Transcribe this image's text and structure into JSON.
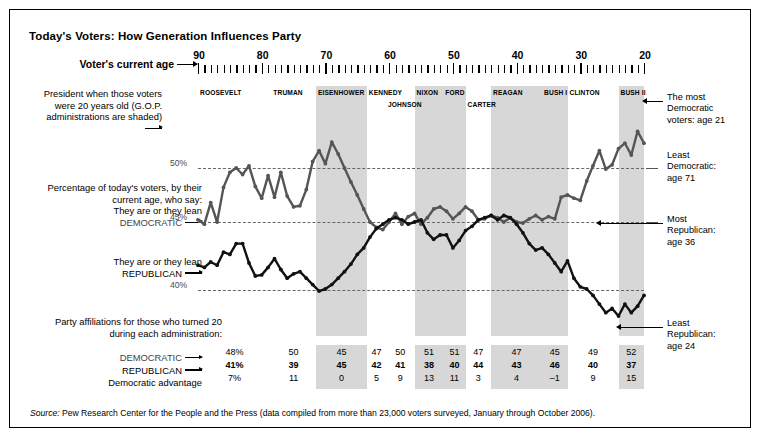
{
  "title": "Today's Voters: How Generation Influences Party",
  "axis": {
    "label": "Voter's current age",
    "ticks": [
      "90",
      "80",
      "70",
      "60",
      "50",
      "40",
      "30",
      "20"
    ],
    "min_age": 20,
    "max_age": 90
  },
  "president_caption": "President when those voters were 20 years old (G.O.P. administrations are shaded)",
  "pct_caption_1": "Percentage of today's voters, by their current age, who say:",
  "pct_caption_2": "They are or they lean",
  "dem_caption": "DEMOCRATIC",
  "rep_caption_2": "They are or they lean",
  "rep_caption": "REPUBLICAN",
  "party_caption": "Party affiliations for those who turned 20 during each administration:",
  "row_labels": {
    "democratic": "DEMOCRATIC",
    "republican": "REPUBLICAN",
    "advantage": "Democratic advantage"
  },
  "gridlines": [
    {
      "label": "50%",
      "value": 50
    },
    {
      "label": "45%",
      "value": 45
    },
    {
      "label": "40%",
      "value": 40
    }
  ],
  "annotations": [
    {
      "name": "most-democratic",
      "lines": [
        "The most",
        "Democratic",
        "voters: age 21"
      ]
    },
    {
      "name": "least-democratic",
      "lines": [
        "Least",
        "Democratic:",
        "age 71"
      ]
    },
    {
      "name": "most-republican",
      "lines": [
        "Most",
        "Republican:",
        "age 36"
      ]
    },
    {
      "name": "least-republican",
      "lines": [
        "Least",
        "Republican:",
        "age 24"
      ]
    }
  ],
  "source": {
    "prefix": "Source:",
    "text": " Pew Research Center for the People and the Press (data compiled from more than 23,000 voters surveyed, January through October 2006)."
  },
  "chart_data": {
    "type": "line",
    "title": "Today's Voters: How Generation Influences Party",
    "xlabel": "Voter's current age",
    "ylabel": "Percentage of today's voters",
    "xlim": [
      90,
      20
    ],
    "ylim": [
      34,
      56
    ],
    "grid": true,
    "gridlines_y": [
      50,
      45,
      40
    ],
    "x_reversed": true,
    "x": [
      90,
      89,
      88,
      87,
      86,
      85,
      84,
      83,
      82,
      81,
      80,
      79,
      78,
      77,
      76,
      75,
      74,
      73,
      72,
      71,
      70,
      69,
      68,
      67,
      66,
      65,
      64,
      63,
      62,
      61,
      60,
      59,
      58,
      57,
      56,
      55,
      54,
      53,
      52,
      51,
      50,
      49,
      48,
      47,
      46,
      45,
      44,
      43,
      42,
      41,
      40,
      39,
      38,
      37,
      36,
      35,
      34,
      33,
      32,
      31,
      30,
      29,
      28,
      27,
      26,
      25,
      24,
      23,
      22,
      21,
      20
    ],
    "series": [
      {
        "name": "Democratic",
        "color": "#555555",
        "values": [
          45.2,
          44.8,
          46.8,
          45.0,
          48.2,
          49.6,
          50.0,
          49.4,
          50.2,
          48.3,
          47.2,
          49.3,
          47.3,
          49.6,
          47.4,
          46.4,
          46.5,
          48.0,
          50.6,
          51.6,
          50.4,
          52.4,
          51.3,
          50.0,
          48.7,
          47.5,
          46.2,
          45.0,
          44.5,
          44.3,
          45.0,
          45.8,
          44.8,
          45.5,
          45.8,
          44.8,
          45.4,
          46.2,
          46.4,
          46.0,
          45.3,
          45.8,
          46.4,
          46.0,
          45.2,
          45.3,
          45.6,
          45.4,
          45.0,
          45.4,
          45.0,
          44.9,
          45.3,
          45.6,
          45.2,
          45.5,
          45.3,
          47.3,
          47.5,
          47.2,
          47.0,
          48.8,
          50.2,
          51.6,
          49.9,
          50.3,
          51.8,
          52.3,
          51.2,
          53.4,
          52.3
        ]
      },
      {
        "name": "Republican",
        "color": "#111111",
        "values": [
          41.0,
          40.8,
          41.3,
          41.0,
          42.2,
          42.0,
          43.0,
          43.0,
          41.2,
          40.0,
          40.1,
          40.8,
          41.6,
          40.6,
          39.8,
          40.2,
          40.4,
          39.8,
          39.2,
          38.6,
          38.8,
          39.2,
          39.8,
          40.4,
          41.1,
          42.0,
          42.6,
          43.6,
          44.4,
          44.8,
          45.2,
          45.4,
          45.2,
          44.8,
          45.0,
          45.2,
          44.0,
          43.4,
          43.8,
          43.8,
          42.6,
          43.3,
          44.2,
          44.6,
          45.2,
          45.4,
          45.6,
          45.2,
          45.6,
          45.4,
          44.8,
          44.0,
          43.0,
          42.4,
          42.6,
          42.0,
          41.2,
          40.4,
          41.4,
          39.8,
          39.0,
          38.8,
          38.2,
          37.4,
          36.6,
          37.0,
          36.3,
          37.4,
          36.6,
          37.2,
          38.2
        ]
      }
    ],
    "annotations": [
      {
        "label": "The most Democratic voters: age 21",
        "age": 21,
        "series": "Democratic"
      },
      {
        "label": "Least Democratic: age 71",
        "age": 71,
        "series": "Democratic"
      },
      {
        "label": "Most Republican: age 36",
        "age": 36,
        "series": "Republican"
      },
      {
        "label": "Least Republican: age 24",
        "age": 24,
        "series": "Republican"
      }
    ],
    "presidents": [
      {
        "name": "ROOSEVELT",
        "gop": false,
        "start_age": 90,
        "end_age": 78.5
      },
      {
        "name": "TRUMAN",
        "gop": false,
        "start_age": 78.5,
        "end_age": 71.5
      },
      {
        "name": "EISENHOWER",
        "gop": true,
        "start_age": 71.5,
        "end_age": 63.5
      },
      {
        "name": "KENNEDY",
        "gop": false,
        "start_age": 63.5,
        "end_age": 60.5
      },
      {
        "name": "JOHNSON",
        "gop": false,
        "start_age": 60.5,
        "end_age": 56.0
      },
      {
        "name": "NIXON",
        "gop": true,
        "start_age": 56.0,
        "end_age": 51.5
      },
      {
        "name": "FORD",
        "gop": true,
        "start_age": 51.5,
        "end_age": 48.0
      },
      {
        "name": "CARTER",
        "gop": false,
        "start_age": 48.0,
        "end_age": 44.0
      },
      {
        "name": "REAGAN",
        "gop": true,
        "start_age": 44.0,
        "end_age": 36.0
      },
      {
        "name": "BUSH I",
        "gop": true,
        "start_age": 36.0,
        "end_age": 32.0
      },
      {
        "name": "CLINTON",
        "gop": false,
        "start_age": 32.0,
        "end_age": 24.0
      },
      {
        "name": "BUSH II",
        "gop": true,
        "start_age": 24.0,
        "end_age": 20.0
      }
    ],
    "table": {
      "columns": [
        "ROOSEVELT",
        "TRUMAN",
        "EISENHOWER",
        "KENNEDY",
        "JOHNSON",
        "NIXON",
        "FORD",
        "CARTER",
        "REAGAN",
        "BUSH I",
        "CLINTON",
        "BUSH II"
      ],
      "democratic": [
        "48%",
        "50",
        "45",
        "47",
        "50",
        "51",
        "51",
        "47",
        "47",
        "45",
        "49",
        "52"
      ],
      "republican": [
        "41%",
        "39",
        "45",
        "42",
        "41",
        "38",
        "40",
        "44",
        "43",
        "46",
        "40",
        "37"
      ],
      "advantage": [
        "7%",
        "11",
        "0",
        "5",
        "9",
        "13",
        "11",
        "3",
        "4",
        "-1",
        "9",
        "15"
      ],
      "shaded": [
        false,
        false,
        true,
        false,
        false,
        true,
        true,
        false,
        true,
        true,
        false,
        true
      ]
    }
  }
}
